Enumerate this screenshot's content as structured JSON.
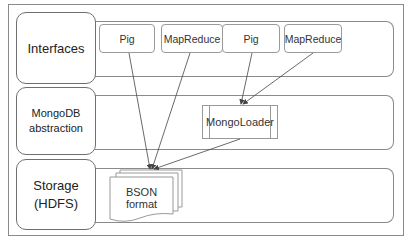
{
  "diagram": {
    "layers": [
      {
        "label": "Interfaces"
      },
      {
        "label": "MongoDB\nabstraction",
        "line1": "MongoDB",
        "line2": "abstraction"
      },
      {
        "label": "Storage\n(HDFS)",
        "line1": "Storage",
        "line2": "(HDFS)"
      }
    ],
    "interface_boxes": [
      {
        "label": "Pig"
      },
      {
        "label": "MapReduce"
      },
      {
        "label": "Pig"
      },
      {
        "label": "MapReduce"
      }
    ],
    "abstraction_box": {
      "label": "MongoLoader"
    },
    "storage_box": {
      "label": "BSON format"
    },
    "edges": [
      {
        "from": "Pig (1)",
        "to": "BSON format"
      },
      {
        "from": "MapReduce (1)",
        "to": "BSON format"
      },
      {
        "from": "Pig (2)",
        "to": "MongoLoader"
      },
      {
        "from": "MapReduce (2)",
        "to": "MongoLoader"
      },
      {
        "from": "MongoLoader",
        "to": "BSON format"
      }
    ],
    "colors": {
      "line": "#444444",
      "border": "#8a8a8a"
    }
  }
}
